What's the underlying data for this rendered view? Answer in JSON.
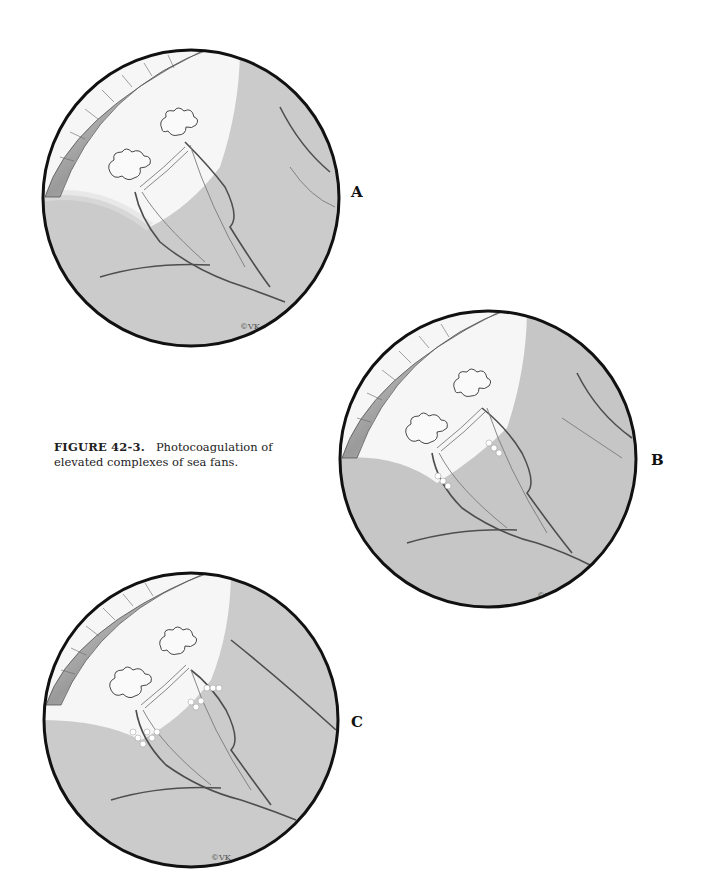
{
  "figure": {
    "number_label": "FIGURE 42-3.",
    "caption_text": "Photocoagulation of elevated complexes of sea fans."
  },
  "panels": [
    {
      "id": "A",
      "label": "A",
      "description": "Elevated sea fan neovascular complexes before treatment",
      "laser_spots": false,
      "signature": "©VK"
    },
    {
      "id": "B",
      "label": "B",
      "description": "Laser spots applied to feeder vessels",
      "laser_spots": true,
      "signature": "©VK"
    },
    {
      "id": "C",
      "label": "C",
      "description": "Confluent laser spots surrounding feeder vessels",
      "laser_spots": true,
      "signature": "©VK"
    }
  ],
  "colors": {
    "fundus_gray": "#c9c9c9",
    "highlight": "#f7f7f7",
    "outline": "#111111",
    "vessel": "#555555"
  }
}
